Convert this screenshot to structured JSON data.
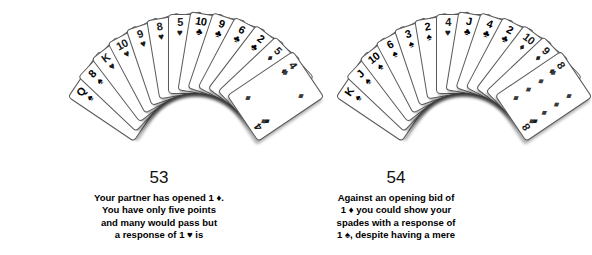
{
  "figure": {
    "type": "two-bridge-hands",
    "background_color": "#ffffff",
    "card_face_color": "#ffffff",
    "card_border_color": "#5a5a5a",
    "pip_color": "#3a3a3a"
  },
  "side_tab": {
    "label": "responses"
  },
  "hands": [
    {
      "id": "hand-53",
      "caption_number": "53",
      "caption_lines": [
        "Your partner has opened 1 ♦.",
        "You have only five points",
        "and many would pass but",
        "a response of 1 ♥ is"
      ],
      "cards": [
        {
          "rank": "Q",
          "suit": "♠",
          "suit_name": "spades",
          "color": "black"
        },
        {
          "rank": "8",
          "suit": "♠",
          "suit_name": "spades",
          "color": "black"
        },
        {
          "rank": "K",
          "suit": "♥",
          "suit_name": "hearts",
          "color": "red"
        },
        {
          "rank": "10",
          "suit": "♥",
          "suit_name": "hearts",
          "color": "red"
        },
        {
          "rank": "9",
          "suit": "♥",
          "suit_name": "hearts",
          "color": "red"
        },
        {
          "rank": "8",
          "suit": "♥",
          "suit_name": "hearts",
          "color": "red"
        },
        {
          "rank": "5",
          "suit": "♥",
          "suit_name": "hearts",
          "color": "red"
        },
        {
          "rank": "10",
          "suit": "♣",
          "suit_name": "clubs",
          "color": "black"
        },
        {
          "rank": "9",
          "suit": "♣",
          "suit_name": "clubs",
          "color": "black"
        },
        {
          "rank": "6",
          "suit": "♣",
          "suit_name": "clubs",
          "color": "black"
        },
        {
          "rank": "2",
          "suit": "♣",
          "suit_name": "clubs",
          "color": "black"
        },
        {
          "rank": "5",
          "suit": "♦",
          "suit_name": "diamonds",
          "color": "red"
        },
        {
          "rank": "4",
          "suit": "♦",
          "suit_name": "diamonds",
          "color": "red",
          "front": true,
          "pip_count": 4
        }
      ]
    },
    {
      "id": "hand-54",
      "caption_number": "54",
      "caption_lines": [
        "Against an opening bid of",
        "1 ♦ you could show your",
        "spades with a response of",
        "1 ♠, despite having a mere"
      ],
      "cards": [
        {
          "rank": "K",
          "suit": "♠",
          "suit_name": "spades",
          "color": "black"
        },
        {
          "rank": "J",
          "suit": "♠",
          "suit_name": "spades",
          "color": "black"
        },
        {
          "rank": "10",
          "suit": "♠",
          "suit_name": "spades",
          "color": "black"
        },
        {
          "rank": "6",
          "suit": "♠",
          "suit_name": "spades",
          "color": "black"
        },
        {
          "rank": "3",
          "suit": "♠",
          "suit_name": "spades",
          "color": "black"
        },
        {
          "rank": "2",
          "suit": "♠",
          "suit_name": "spades",
          "color": "black"
        },
        {
          "rank": "4",
          "suit": "♥",
          "suit_name": "hearts",
          "color": "red"
        },
        {
          "rank": "J",
          "suit": "♣",
          "suit_name": "clubs",
          "color": "black"
        },
        {
          "rank": "4",
          "suit": "♣",
          "suit_name": "clubs",
          "color": "black"
        },
        {
          "rank": "2",
          "suit": "♣",
          "suit_name": "clubs",
          "color": "black"
        },
        {
          "rank": "10",
          "suit": "♦",
          "suit_name": "diamonds",
          "color": "red"
        },
        {
          "rank": "9",
          "suit": "♦",
          "suit_name": "diamonds",
          "color": "red"
        },
        {
          "rank": "8",
          "suit": "♦",
          "suit_name": "diamonds",
          "color": "red",
          "front": true,
          "pip_count": 8
        }
      ]
    }
  ]
}
